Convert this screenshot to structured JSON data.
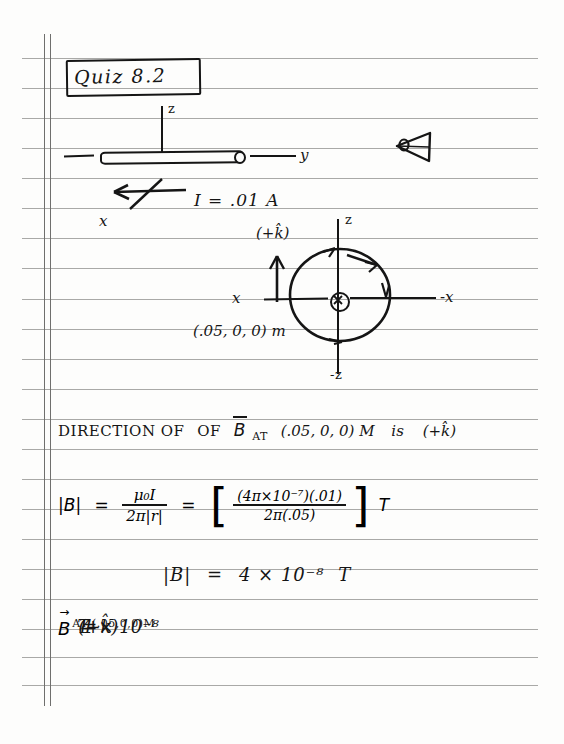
{
  "page": {
    "kind": "handwritten-notebook-page",
    "paper": {
      "background_color": "#fdfdfc",
      "rule_color": "#9a9a98",
      "margin_color": "#6f6f6d",
      "ink_color": "#151515",
      "rule_spacing_px": 30,
      "first_rule_y_px": 58,
      "rule_count": 22,
      "margin_line_count": 2
    }
  },
  "title": {
    "text": "Quiz 8.2",
    "boxed": true
  },
  "wire_diagram": {
    "z_axis_label": "z",
    "y_axis_label": "y",
    "x_axis_label": "x",
    "current_label": "I = .01 A",
    "eye_icon_name": "eye-viewpoint-icon",
    "wire_icon_name": "current-carrying-wire"
  },
  "field_diagram": {
    "z_axis_label": "z",
    "neg_z_axis_label": "-z",
    "x_axis_label": "x",
    "neg_x_axis_label": "-x",
    "unit_vector_label": "(+k̂)",
    "point_label": "(.05, 0, 0) m",
    "current_into_page_symbol": "⊗",
    "field_line_sense": "counterclockwise-arrows-on-circle"
  },
  "statement": {
    "prefix": "DIRECTION OF",
    "vector": "B",
    "at": "AT",
    "point": "(.05, 0, 0) M",
    "is": "is",
    "answer": "(+k̂)"
  },
  "formula": {
    "lhs": "|B|",
    "eq1": "=",
    "frac1_num": "μ₀I",
    "frac1_den": "2π|r|",
    "eq2": "=",
    "bracket_open": "[",
    "frac2_num": "(4π×10⁻⁷)(.01)",
    "frac2_den": "2π(.05)",
    "bracket_close": "]",
    "units": "T"
  },
  "result": {
    "lhs": "|B|",
    "eq": "=",
    "value": "4 × 10⁻⁸",
    "units": "T"
  },
  "final_answer": {
    "vector": "B",
    "subscript": "AT (.05,0,0)M",
    "eq": "=",
    "value": "4 × 10⁻⁸",
    "units": "T",
    "direction": "(+k̂)"
  }
}
